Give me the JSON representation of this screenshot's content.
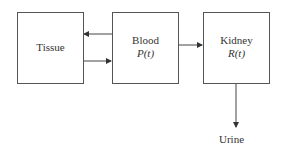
{
  "diagram": {
    "nodes": [
      {
        "id": "tissue",
        "label": "Tissue",
        "sublabel": ""
      },
      {
        "id": "blood",
        "label": "Blood",
        "sublabel": "P(t)"
      },
      {
        "id": "kidney",
        "label": "Kidney",
        "sublabel": "R(t)"
      }
    ],
    "terminal": {
      "id": "urine",
      "label": "Urine"
    },
    "edges": [
      {
        "from": "blood",
        "to": "tissue"
      },
      {
        "from": "tissue",
        "to": "blood"
      },
      {
        "from": "blood",
        "to": "kidney"
      },
      {
        "from": "kidney",
        "to": "urine"
      }
    ]
  }
}
